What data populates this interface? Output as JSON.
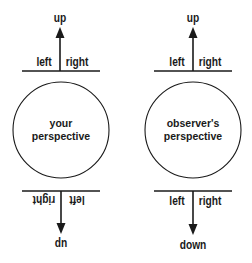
{
  "diagram": {
    "panels": [
      {
        "id": "your",
        "circle_label_line1": "your",
        "circle_label_line2": "perspective",
        "top": {
          "arrow_label": "up",
          "left_label": "left",
          "right_label": "right"
        },
        "bottom": {
          "arrow_label": "up",
          "left_label": "left",
          "right_label": "right",
          "flipped": true
        }
      },
      {
        "id": "observer",
        "circle_label_line1": "observer's",
        "circle_label_line2": "perspective",
        "top": {
          "arrow_label": "up",
          "left_label": "left",
          "right_label": "right"
        },
        "bottom": {
          "arrow_label": "down",
          "left_label": "left",
          "right_label": "right",
          "flipped": false
        }
      }
    ],
    "colors": {
      "stroke": "#1a1a1a",
      "background": "#ffffff"
    }
  }
}
